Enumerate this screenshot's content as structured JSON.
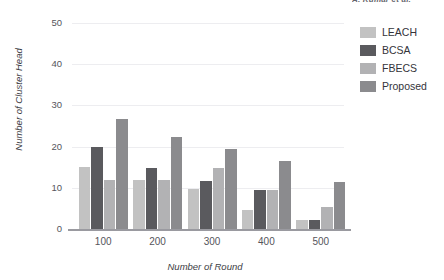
{
  "header": {
    "fragment_text": "A. Kumar et al."
  },
  "chart_data": {
    "type": "bar",
    "title": "",
    "xlabel": "Number of Round",
    "ylabel": "Number of Cluster Head",
    "categories": [
      "100",
      "200",
      "300",
      "400",
      "500"
    ],
    "ylim": [
      0,
      50
    ],
    "yticks": [
      0,
      10,
      20,
      30,
      40,
      50
    ],
    "ytick_labels": [
      "0",
      "10",
      "20",
      "30",
      "40",
      "50"
    ],
    "grid": true,
    "grid_axis": "y",
    "legend_position": "right",
    "series": [
      {
        "name": "LEACH",
        "color": "#c2c2c2",
        "values": [
          15.0,
          11.8,
          9.7,
          4.5,
          2.2
        ]
      },
      {
        "name": "BCSA",
        "color": "#5a5a5e",
        "values": [
          19.8,
          14.8,
          11.7,
          9.5,
          2.2
        ]
      },
      {
        "name": "FBECS",
        "color": "#b2b2b4",
        "values": [
          11.8,
          11.8,
          14.7,
          9.4,
          5.3
        ]
      },
      {
        "name": "Proposed",
        "color": "#8b8b8e",
        "values": [
          26.8,
          22.4,
          19.5,
          16.5,
          11.3
        ]
      }
    ]
  }
}
